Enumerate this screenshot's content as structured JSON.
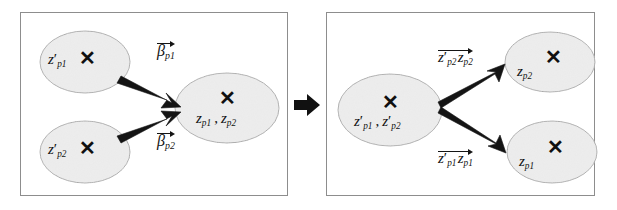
{
  "figure": {
    "background_color": "#ffffff",
    "panel_border_color": "#8d8d8d",
    "ellipse_fill_color": "#e9e9e9",
    "ellipse_stroke_color": "#9a9a9a",
    "arrow_color": "#141414",
    "text_color": "#121212"
  },
  "transition_arrow": {
    "icon": "right-arrow-icon",
    "direction": "right"
  },
  "left_panel": {
    "name": "merge-panel",
    "nodes": [
      {
        "id": "node-zp1-prime",
        "marker": "X",
        "base": "z",
        "prime": "′",
        "subscript": "p1",
        "text": "z′p1"
      },
      {
        "id": "node-zp2-prime",
        "marker": "X",
        "base": "z",
        "prime": "′",
        "subscript": "p2",
        "text": "z′p2"
      },
      {
        "id": "node-merged",
        "marker": "X",
        "parts": [
          {
            "base": "z",
            "subscript": "p1"
          },
          {
            "separator": ","
          },
          {
            "base": "z",
            "subscript": "p2"
          }
        ],
        "text": "zp1 , zp2"
      }
    ],
    "edges": [
      {
        "id": "edge-beta-p1",
        "from": "node-zp1-prime",
        "to": "node-merged",
        "label": {
          "base": "β",
          "subscript": "p1",
          "accent": "vector-arrow",
          "text": "βp1"
        }
      },
      {
        "id": "edge-beta-p2",
        "from": "node-zp2-prime",
        "to": "node-merged",
        "label": {
          "base": "β",
          "subscript": "p2",
          "accent": "vector-arrow",
          "text": "βp2"
        }
      }
    ]
  },
  "right_panel": {
    "name": "split-panel",
    "nodes": [
      {
        "id": "node-merged-prime",
        "marker": "X",
        "parts": [
          {
            "base": "z",
            "prime": "′",
            "subscript": "p1"
          },
          {
            "separator": ","
          },
          {
            "base": "z",
            "prime": "′",
            "subscript": "p2"
          }
        ],
        "text": "z′p1 , z′p2"
      },
      {
        "id": "node-zp2",
        "marker": "X",
        "base": "z",
        "subscript": "p2",
        "text": "zp2"
      },
      {
        "id": "node-zp1",
        "marker": "X",
        "base": "z",
        "subscript": "p1",
        "text": "zp1"
      }
    ],
    "edges": [
      {
        "id": "edge-zp2prime-zp2",
        "from": "node-merged-prime",
        "to": "node-zp2",
        "label": {
          "accent": "vector-arrow",
          "parts": [
            {
              "base": "z",
              "prime": "′",
              "subscript": "p2"
            },
            {
              "base": "z",
              "subscript": "p2"
            }
          ],
          "text": "z′p2 zp2"
        }
      },
      {
        "id": "edge-zp1prime-zp1",
        "from": "node-merged-prime",
        "to": "node-zp1",
        "label": {
          "accent": "vector-arrow",
          "parts": [
            {
              "base": "z",
              "prime": "′",
              "subscript": "p1"
            },
            {
              "base": "z",
              "subscript": "p1"
            }
          ],
          "text": "z′p1 zp1"
        }
      }
    ]
  }
}
